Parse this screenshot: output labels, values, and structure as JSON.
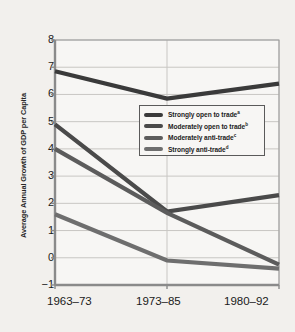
{
  "chart_data": {
    "type": "line",
    "title": "",
    "xlabel": "",
    "ylabel": "Average Annual Growth of GDP per Capita",
    "categories": [
      "1963–73",
      "1973–85",
      "1980–92"
    ],
    "ylim": [
      -1,
      8
    ],
    "yticks": [
      8,
      7,
      6,
      5,
      4,
      3,
      2,
      1,
      0,
      -1
    ],
    "ytick_labels": [
      "8",
      "7",
      "6",
      "5",
      "4",
      "3",
      "2",
      "1",
      "0",
      "−1"
    ],
    "grid": true,
    "legend_position": "center",
    "series": [
      {
        "name": "Strongly open to trade",
        "footnote": "a",
        "color": "#3a3a3a",
        "values": [
          6.85,
          5.85,
          6.4
        ]
      },
      {
        "name": "Moderately open to trade",
        "footnote": "b",
        "color": "#4a4a4a",
        "values": [
          4.9,
          1.7,
          2.3
        ]
      },
      {
        "name": "Moderately anti-trade",
        "footnote": "c",
        "color": "#5c5c5c",
        "values": [
          4.0,
          1.65,
          -0.25
        ]
      },
      {
        "name": "Strongly anti-trade",
        "footnote": "d",
        "color": "#6e6e6e",
        "values": [
          1.6,
          -0.1,
          -0.4
        ]
      }
    ]
  },
  "axes": {
    "background": "#f7f6f4",
    "grid_color": "#c8c6c3",
    "frame_color": "#9a9a9a",
    "axis_color": "#8a8a8a"
  },
  "page": {
    "background": "#f2f0ed"
  }
}
